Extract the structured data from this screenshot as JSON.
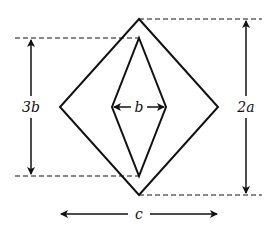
{
  "diagram": {
    "labels": {
      "height_inner": "3b",
      "width_inner": "b",
      "height_outer": "2a",
      "width_outer": "c"
    },
    "stroke_color": "#111111",
    "background": "#ffffff"
  }
}
